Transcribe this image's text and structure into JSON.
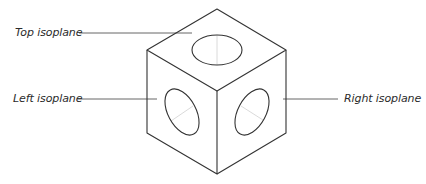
{
  "diagram": {
    "type": "isometric-cube",
    "labels": {
      "top": "Top isoplane",
      "left": "Left isoplane",
      "right": "Right isoplane"
    },
    "colors": {
      "stroke": "#333333",
      "leader": "#555555",
      "axis_hint": "#cccccc",
      "text": "#2b2b2b",
      "background": "#ffffff"
    }
  }
}
